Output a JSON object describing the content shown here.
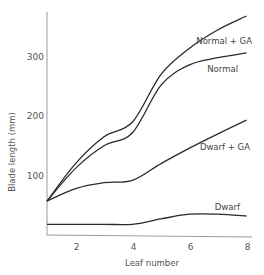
{
  "chart_data": {
    "type": "line",
    "title": "",
    "xlabel": "Leaf number",
    "ylabel": "Blade length (mm)",
    "xlim": [
      1,
      8
    ],
    "ylim": [
      0,
      370
    ],
    "xticks": [
      2,
      4,
      6,
      8
    ],
    "yticks": [
      100,
      200,
      300
    ],
    "grid": false,
    "legend": "inline labels near line ends",
    "x": [
      1,
      2,
      3,
      4,
      5,
      6,
      7,
      8
    ],
    "series": [
      {
        "name": "Normal + GA",
        "values": [
          57,
          120,
          165,
          190,
          270,
          314,
          345,
          368
        ]
      },
      {
        "name": "Normal",
        "values": [
          57,
          112,
          150,
          172,
          252,
          286,
          298,
          306
        ]
      },
      {
        "name": "Dwarf + GA",
        "values": [
          57,
          78,
          88,
          92,
          120,
          146,
          170,
          193
        ]
      },
      {
        "name": "Dwarf",
        "values": [
          18,
          18,
          18,
          18,
          27,
          35,
          35,
          32
        ]
      }
    ],
    "annotations": [
      "Normal + GA",
      "Normal",
      "Dwarf + GA",
      "Dwarf"
    ]
  }
}
